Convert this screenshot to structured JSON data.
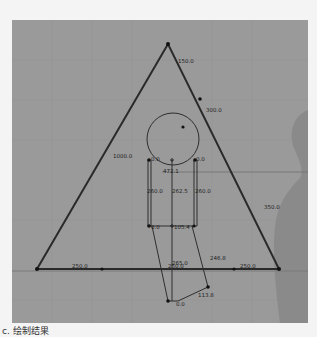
{
  "caption": "c. 绘制结果",
  "top_text": "",
  "colors": {
    "canvas_bg": "#9a9a9a",
    "grid_line": "#929292",
    "shape_stroke": "#2a2a2a",
    "vertex": "#111111",
    "silhouette": "#888888",
    "label": "#1e1e1e"
  },
  "diagram": {
    "triangle": {
      "edge_labels": {
        "left": "1000.0",
        "right_upper_1": "150.0",
        "right_upper_2": "300.0",
        "right_lower": "350.0",
        "bottom_left": "250.0",
        "bottom_mid": "250.0",
        "bottom_right": "250.0"
      }
    },
    "figure": {
      "head_label": "472.1",
      "left_node_label": "0.0",
      "right_node_label": "0.0",
      "left_vertical": "260.0",
      "center_vertical": "262.5",
      "right_vertical": "260.0",
      "hip_left": "0.0",
      "hip_center": "105.4",
      "lower_left_label": "265.0",
      "lower_right_label": "246.8",
      "foot_label": "113.8",
      "foot_node": "0.0"
    }
  }
}
